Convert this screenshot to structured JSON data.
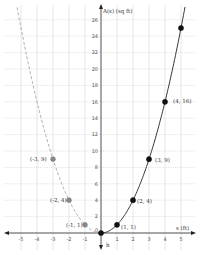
{
  "chart_data": {
    "type": "line",
    "title": "",
    "xlabel": "s (ft)",
    "ylabel": "A(s) (sq ft)",
    "xlim": [
      -5.5,
      5.5
    ],
    "ylim": [
      -1.5,
      27
    ],
    "x_ticks": [
      -5,
      -4,
      -3,
      -2,
      -1,
      0,
      1,
      2,
      3,
      4,
      5
    ],
    "y_ticks": [
      2,
      4,
      6,
      8,
      10,
      12,
      14,
      16,
      18,
      20,
      22,
      24,
      26
    ],
    "grid": true,
    "origin_label": "0",
    "axis_arrow_label": "h",
    "series": [
      {
        "name": "A(s) = s^2, s >= 0",
        "style": "solid",
        "color": "#222222",
        "points": [
          [
            0,
            0
          ],
          [
            1,
            1
          ],
          [
            2,
            4
          ],
          [
            3,
            9
          ],
          [
            4,
            16
          ],
          [
            5,
            25
          ]
        ],
        "labels": [
          "",
          "(1, 1)",
          "(2, 4)",
          "(3, 9)",
          "(4, 16)",
          ""
        ]
      },
      {
        "name": "s^2, s < 0",
        "style": "dashed",
        "color": "#999999",
        "points": [
          [
            -1,
            1
          ],
          [
            -2,
            4
          ],
          [
            -3,
            9
          ]
        ],
        "labels": [
          "(-1, 1)",
          "(-2, 4)",
          "(-3, 9)"
        ]
      }
    ]
  },
  "colors": {
    "solid_curve": "#222222",
    "dashed_curve": "#999999",
    "solid_point": "#111111",
    "dashed_point": "#8a8a8a",
    "grid": "#cccccc"
  }
}
